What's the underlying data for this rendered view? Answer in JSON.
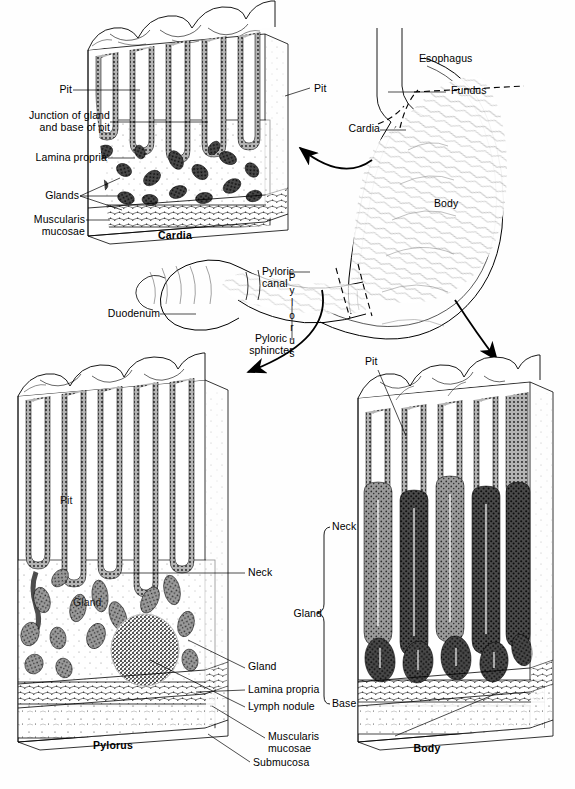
{
  "figure": {
    "background_color": "#ffffff",
    "ink_color": "#000000"
  },
  "panels": {
    "cardia": {
      "caption": "Cardia",
      "labels": {
        "pit_left": "Pit",
        "pit_right": "Pit",
        "junction": "Junction of gland\nand base of pit",
        "lamina_propria": "Lamina propria",
        "glands": "Glands",
        "muscularis_mucosae": "Muscularis\nmucosae"
      }
    },
    "pylorus": {
      "caption": "Pylorus",
      "labels": {
        "pit": "Pit",
        "gland_inner": "Gland",
        "neck": "Neck",
        "gland": "Gland",
        "lamina_propria": "Lamina propria",
        "lymph_nodule": "Lymph nodule",
        "muscularis_mucosae": "Muscularis\nmucosae",
        "submucosa": "Submucosa"
      }
    },
    "body": {
      "caption": "Body",
      "labels": {
        "pit": "Pit",
        "neck": "Neck",
        "gland": "Gland",
        "base": "Base"
      }
    }
  },
  "stomach_overview": {
    "labels": {
      "esophagus": "Esophagus",
      "fundus": "Fundus",
      "cardia": "Cardia",
      "body": "Body",
      "pylorus_vertical": "Pylorus",
      "pyloric_canal": "Pyloric\ncanal",
      "pyloric_sphincter": "Pyloric\nsphincter",
      "duodenum": "Duodenum"
    }
  }
}
